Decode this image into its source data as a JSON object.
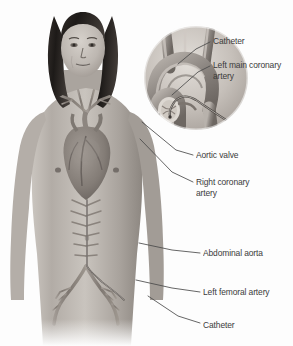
{
  "illustration": {
    "title": "Cardiac catheterization via femoral artery approach",
    "background_color": "#fdfdfd",
    "label_color": "#3b3b3b",
    "leader_line_color": "#4a4a4a"
  },
  "subject": {
    "description": "Anterior view of a standing adult male figure with long dark hair, shown with internal cardiovascular anatomy overlaid on the torso",
    "skin_tone": "#b9b3ad",
    "hair_color": "#2e2a28",
    "vessel_color": "#8e8782"
  },
  "inset": {
    "name": "aortic-arch-detail",
    "description": "Circular cutaway detail of the aortic arch showing three great vessel branches, the aortic root and valve, and a catheter advanced to the left main coronary ostium",
    "branch_count": 3
  },
  "callouts": [
    {
      "id": "catheter-arch",
      "label": "Catheter",
      "text_x": 213,
      "text_y": 36,
      "line": [
        [
          210,
          42
        ],
        [
          196,
          49
        ],
        [
          178,
          64
        ]
      ]
    },
    {
      "id": "left-main-coronary-artery",
      "label": "Left main coronary\nartery",
      "text_x": 213,
      "text_y": 60,
      "line": [
        [
          210,
          66
        ],
        [
          198,
          72
        ],
        [
          172,
          95
        ]
      ]
    },
    {
      "id": "aortic-valve",
      "label": "Aortic valve",
      "text_x": 196,
      "text_y": 150,
      "line": [
        [
          193,
          155
        ],
        [
          176,
          150
        ],
        [
          142,
          122
        ]
      ]
    },
    {
      "id": "right-coronary-artery",
      "label": "Right coronary\nartery",
      "text_x": 196,
      "text_y": 177,
      "line": [
        [
          193,
          182
        ],
        [
          172,
          172
        ],
        [
          140,
          139
        ]
      ]
    },
    {
      "id": "abdominal-aorta",
      "label": "Abdominal aorta",
      "text_x": 203,
      "text_y": 248,
      "line": [
        [
          200,
          253
        ],
        [
          172,
          250
        ],
        [
          139,
          243
        ]
      ]
    },
    {
      "id": "left-femoral-artery",
      "label": "Left femoral artery",
      "text_x": 203,
      "text_y": 287,
      "line": [
        [
          200,
          292
        ],
        [
          172,
          288
        ],
        [
          136,
          280
        ]
      ]
    },
    {
      "id": "catheter-femoral",
      "label": "Catheter",
      "text_x": 203,
      "text_y": 320,
      "line": [
        [
          200,
          323
        ],
        [
          178,
          316
        ],
        [
          148,
          296
        ]
      ]
    }
  ]
}
